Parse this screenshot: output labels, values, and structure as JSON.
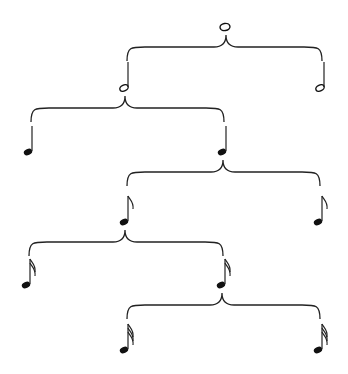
{
  "diagram": {
    "colors": {
      "ink": "#222222",
      "background": "#ffffff"
    },
    "nodes": [
      {
        "id": "whole",
        "label": "whole note",
        "level": 0,
        "x": 225,
        "y": 27,
        "type": "whole"
      },
      {
        "id": "half-left",
        "label": "half note",
        "level": 1,
        "x": 124,
        "y": 88,
        "type": "half"
      },
      {
        "id": "half-right",
        "label": "half note",
        "level": 1,
        "x": 320,
        "y": 88,
        "type": "half"
      },
      {
        "id": "quarter-left",
        "label": "quarter note",
        "level": 2,
        "x": 28,
        "y": 152,
        "type": "quarter"
      },
      {
        "id": "quarter-right",
        "label": "quarter note",
        "level": 2,
        "x": 222,
        "y": 152,
        "type": "quarter"
      },
      {
        "id": "eighth-left",
        "label": "eighth note",
        "level": 3,
        "x": 124,
        "y": 222,
        "type": "eighth"
      },
      {
        "id": "eighth-right",
        "label": "eighth note",
        "level": 3,
        "x": 318,
        "y": 222,
        "type": "eighth"
      },
      {
        "id": "sixteenth-left",
        "label": "sixteenth note",
        "level": 4,
        "x": 26,
        "y": 285,
        "type": "sixteenth"
      },
      {
        "id": "sixteenth-right",
        "label": "sixteenth note",
        "level": 4,
        "x": 221,
        "y": 285,
        "type": "sixteenth"
      },
      {
        "id": "thirtysecond-left",
        "label": "thirty-second note",
        "level": 5,
        "x": 124,
        "y": 350,
        "type": "thirtysecond"
      },
      {
        "id": "thirtysecond-right",
        "label": "thirty-second note",
        "level": 5,
        "x": 318,
        "y": 350,
        "type": "thirtysecond"
      }
    ],
    "edges": [
      {
        "parent": "whole",
        "children": [
          "half-left",
          "half-right"
        ]
      },
      {
        "parent": "half-left",
        "children": [
          "quarter-left",
          "quarter-right"
        ]
      },
      {
        "parent": "quarter-right",
        "children": [
          "eighth-left",
          "eighth-right"
        ]
      },
      {
        "parent": "eighth-left",
        "children": [
          "sixteenth-left",
          "sixteenth-right"
        ]
      },
      {
        "parent": "sixteenth-right",
        "children": [
          "thirtysecond-left",
          "thirtysecond-right"
        ]
      }
    ]
  }
}
